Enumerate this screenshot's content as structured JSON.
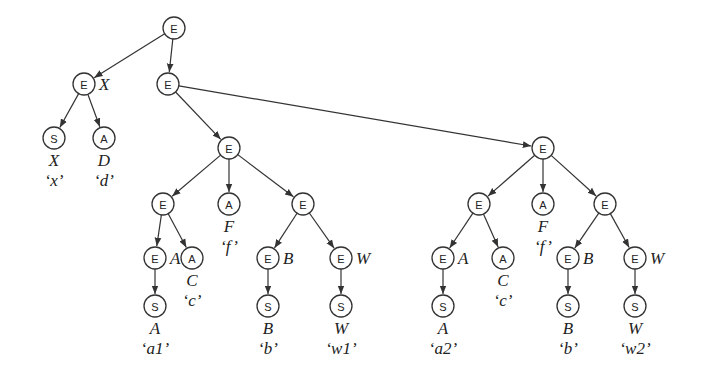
{
  "diagram": {
    "type": "tree",
    "node_radius": 11,
    "colors": {
      "stroke": "#333333",
      "fill": "#ffffff",
      "text": "#222222"
    },
    "nodes": [
      {
        "id": "n0",
        "kind": "E",
        "x": 174,
        "y": 28
      },
      {
        "id": "n1",
        "kind": "E",
        "x": 84,
        "y": 84,
        "side_label": "X"
      },
      {
        "id": "n2",
        "kind": "E",
        "x": 168,
        "y": 84
      },
      {
        "id": "n3",
        "kind": "S",
        "x": 54,
        "y": 138,
        "below": [
          "X",
          "‘x’"
        ]
      },
      {
        "id": "n4",
        "kind": "A",
        "x": 104,
        "y": 138,
        "below": [
          "D",
          "‘d’"
        ]
      },
      {
        "id": "n5",
        "kind": "E",
        "x": 229,
        "y": 148
      },
      {
        "id": "n6",
        "kind": "E",
        "x": 163,
        "y": 204
      },
      {
        "id": "n7",
        "kind": "A",
        "x": 229,
        "y": 204,
        "below": [
          "F",
          "‘f’"
        ]
      },
      {
        "id": "n8",
        "kind": "E",
        "x": 303,
        "y": 204
      },
      {
        "id": "n9",
        "kind": "E",
        "x": 155,
        "y": 258,
        "side_label": "A"
      },
      {
        "id": "n10",
        "kind": "A",
        "x": 192,
        "y": 258,
        "below": [
          "C",
          "‘c’"
        ]
      },
      {
        "id": "n11",
        "kind": "E",
        "x": 268,
        "y": 258,
        "side_label": "B"
      },
      {
        "id": "n12",
        "kind": "E",
        "x": 341,
        "y": 258,
        "side_label": "W"
      },
      {
        "id": "n13",
        "kind": "S",
        "x": 155,
        "y": 306,
        "below": [
          "A",
          "‘a1’"
        ]
      },
      {
        "id": "n14",
        "kind": "S",
        "x": 268,
        "y": 306,
        "below": [
          "B",
          "‘b’"
        ]
      },
      {
        "id": "n15",
        "kind": "S",
        "x": 341,
        "y": 306,
        "below": [
          "W",
          "‘w1’"
        ]
      },
      {
        "id": "n16",
        "kind": "E",
        "x": 543,
        "y": 148
      },
      {
        "id": "n17",
        "kind": "E",
        "x": 479,
        "y": 204
      },
      {
        "id": "n18",
        "kind": "A",
        "x": 543,
        "y": 204,
        "below": [
          "F",
          "‘f’"
        ]
      },
      {
        "id": "n19",
        "kind": "E",
        "x": 605,
        "y": 204
      },
      {
        "id": "n20",
        "kind": "E",
        "x": 443,
        "y": 258,
        "side_label": "A"
      },
      {
        "id": "n21",
        "kind": "A",
        "x": 503,
        "y": 258,
        "below": [
          "C",
          "‘c’"
        ]
      },
      {
        "id": "n22",
        "kind": "E",
        "x": 568,
        "y": 258,
        "side_label": "B"
      },
      {
        "id": "n23",
        "kind": "E",
        "x": 635,
        "y": 258,
        "side_label": "W"
      },
      {
        "id": "n24",
        "kind": "S",
        "x": 443,
        "y": 306,
        "below": [
          "A",
          "‘a2’"
        ]
      },
      {
        "id": "n25",
        "kind": "S",
        "x": 568,
        "y": 306,
        "below": [
          "B",
          "‘b’"
        ]
      },
      {
        "id": "n26",
        "kind": "S",
        "x": 635,
        "y": 306,
        "below": [
          "W",
          "‘w2’"
        ]
      }
    ],
    "edges": [
      [
        "n0",
        "n1"
      ],
      [
        "n0",
        "n2"
      ],
      [
        "n1",
        "n3"
      ],
      [
        "n1",
        "n4"
      ],
      [
        "n2",
        "n5"
      ],
      [
        "n2",
        "n16"
      ],
      [
        "n5",
        "n6"
      ],
      [
        "n5",
        "n7"
      ],
      [
        "n5",
        "n8"
      ],
      [
        "n6",
        "n9"
      ],
      [
        "n6",
        "n10"
      ],
      [
        "n8",
        "n11"
      ],
      [
        "n8",
        "n12"
      ],
      [
        "n9",
        "n13"
      ],
      [
        "n11",
        "n14"
      ],
      [
        "n12",
        "n15"
      ],
      [
        "n16",
        "n17"
      ],
      [
        "n16",
        "n18"
      ],
      [
        "n16",
        "n19"
      ],
      [
        "n17",
        "n20"
      ],
      [
        "n17",
        "n21"
      ],
      [
        "n19",
        "n22"
      ],
      [
        "n19",
        "n23"
      ],
      [
        "n20",
        "n24"
      ],
      [
        "n22",
        "n25"
      ],
      [
        "n23",
        "n26"
      ]
    ]
  }
}
